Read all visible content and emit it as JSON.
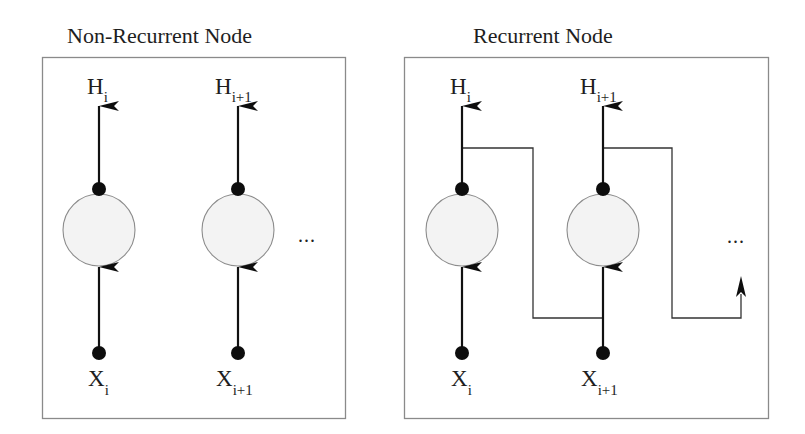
{
  "panels": [
    {
      "title": "Non-Recurrent Node",
      "type": "non-recurrent",
      "nodes": [
        {
          "output_label": "H",
          "output_sub": "i",
          "input_label": "X",
          "input_sub": "i"
        },
        {
          "output_label": "H",
          "output_sub": "i+1",
          "input_label": "X",
          "input_sub": "i+1"
        }
      ],
      "continuation": "..."
    },
    {
      "title": "Recurrent Node",
      "type": "recurrent",
      "nodes": [
        {
          "output_label": "H",
          "output_sub": "i",
          "input_label": "X",
          "input_sub": "i"
        },
        {
          "output_label": "H",
          "output_sub": "i+1",
          "input_label": "X",
          "input_sub": "i+1"
        }
      ],
      "continuation": "..."
    }
  ],
  "colors": {
    "node_fill": "#f3f3f3",
    "node_stroke": "#8c8c8c",
    "arrow": "#111111",
    "box_border": "#8a8a8a"
  }
}
